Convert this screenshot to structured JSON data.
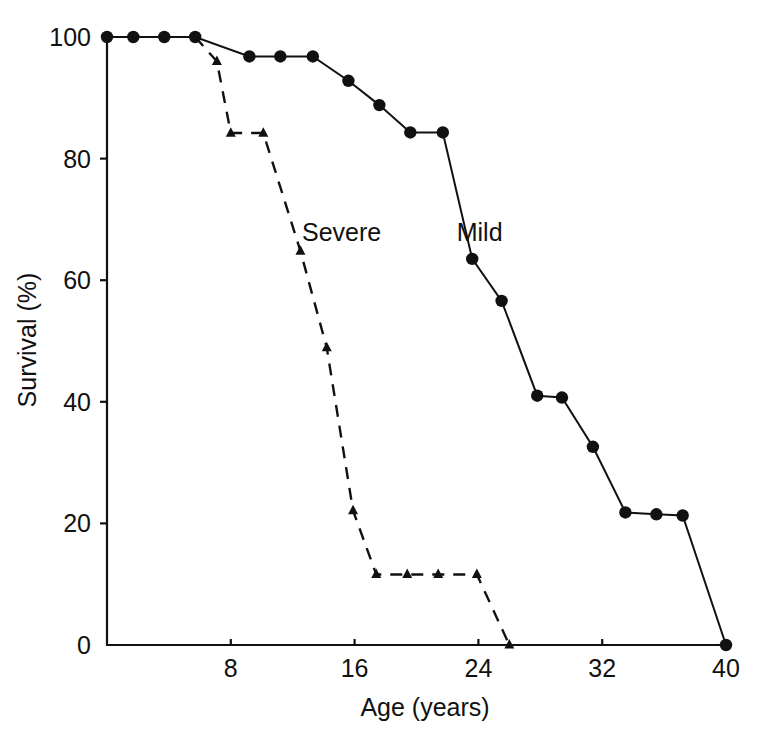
{
  "chart_data": {
    "type": "line",
    "title": "",
    "subtitle": "",
    "xlabel": "Age (years)",
    "ylabel": "Survival (%)",
    "xlim": [
      0,
      40
    ],
    "ylim": [
      0,
      100
    ],
    "xticks": [
      8,
      16,
      24,
      32,
      40
    ],
    "xtick_labels": [
      "8",
      "16",
      "24",
      "32",
      "40"
    ],
    "yticks": [
      0,
      20,
      40,
      60,
      80,
      100
    ],
    "ytick_labels": [
      "0",
      "20",
      "40",
      "60",
      "80",
      "100"
    ],
    "grid": false,
    "legend_position": "inline-annotation",
    "annotations": [
      {
        "text": "Severe",
        "x": 12.6,
        "y": 66.5
      },
      {
        "text": "Mild",
        "x": 22.6,
        "y": 66.5
      }
    ],
    "series": [
      {
        "name": "Mild",
        "label": "Mild",
        "line_style": "solid",
        "marker": "circle",
        "color": "#111111",
        "points": [
          {
            "x": 0.0,
            "y": 100.0
          },
          {
            "x": 1.7,
            "y": 100.0
          },
          {
            "x": 3.7,
            "y": 100.0
          },
          {
            "x": 5.7,
            "y": 100.0
          },
          {
            "x": 9.2,
            "y": 96.8
          },
          {
            "x": 11.2,
            "y": 96.8
          },
          {
            "x": 13.3,
            "y": 96.8
          },
          {
            "x": 15.6,
            "y": 92.8
          },
          {
            "x": 17.6,
            "y": 88.8
          },
          {
            "x": 19.6,
            "y": 84.3
          },
          {
            "x": 21.7,
            "y": 84.3
          },
          {
            "x": 23.6,
            "y": 63.5
          },
          {
            "x": 25.5,
            "y": 56.6
          },
          {
            "x": 27.8,
            "y": 41.0
          },
          {
            "x": 29.4,
            "y": 40.7
          },
          {
            "x": 31.4,
            "y": 32.6
          },
          {
            "x": 33.5,
            "y": 21.8
          },
          {
            "x": 35.5,
            "y": 21.5
          },
          {
            "x": 37.2,
            "y": 21.3
          },
          {
            "x": 40.0,
            "y": 0.0
          }
        ]
      },
      {
        "name": "Severe",
        "label": "Severe",
        "line_style": "dashed",
        "marker": "triangle",
        "color": "#111111",
        "points": [
          {
            "x": 5.7,
            "y": 100.0
          },
          {
            "x": 7.1,
            "y": 96.0
          },
          {
            "x": 8.0,
            "y": 84.2
          },
          {
            "x": 10.1,
            "y": 84.2
          },
          {
            "x": 12.5,
            "y": 64.8
          },
          {
            "x": 14.2,
            "y": 48.9
          },
          {
            "x": 15.9,
            "y": 22.1
          },
          {
            "x": 17.4,
            "y": 11.6
          },
          {
            "x": 19.4,
            "y": 11.6
          },
          {
            "x": 21.4,
            "y": 11.6
          },
          {
            "x": 23.9,
            "y": 11.6
          },
          {
            "x": 26.0,
            "y": 0.0
          }
        ]
      }
    ]
  }
}
